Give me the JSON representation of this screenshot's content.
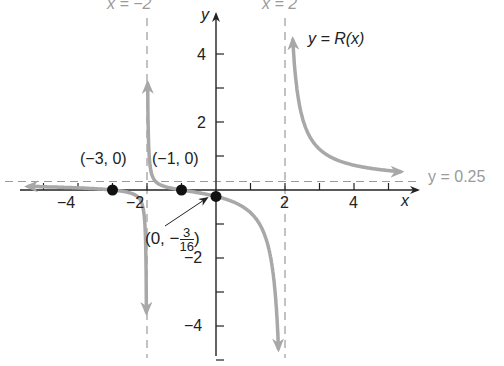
{
  "chart_data": {
    "type": "line",
    "title": "",
    "function_label": "y = R(x)",
    "function": "R(x) = (x+1)(x+3) / (4(x-2)(x+2))",
    "xlabel": "x",
    "ylabel": "y",
    "xlim": [
      -5.5,
      5.5
    ],
    "ylim": [
      -5,
      5
    ],
    "x_ticks": [
      -5,
      -4,
      -3,
      -2,
      -1,
      1,
      2,
      3,
      4,
      5
    ],
    "x_tick_labels": [
      "-4",
      "-2",
      "2",
      "4"
    ],
    "y_ticks": [
      -5,
      -4,
      -3,
      -2,
      -1,
      1,
      2,
      3,
      4
    ],
    "y_tick_labels": [
      "4",
      "2",
      "-2",
      "-4"
    ],
    "grid": false,
    "asymptotes": [
      {
        "type": "vertical",
        "value": -2,
        "label": "x = −2"
      },
      {
        "type": "vertical",
        "value": 2,
        "label": "x = 2"
      },
      {
        "type": "horizontal",
        "value": 0.25,
        "label": "y = 0.25"
      }
    ],
    "points": [
      {
        "x": -3,
        "y": 0,
        "label": "(−3, 0)"
      },
      {
        "x": -1,
        "y": 0,
        "label": "(−1, 0)"
      },
      {
        "x": 0,
        "y": -0.1875,
        "label": "(0, −3/16)"
      }
    ],
    "series": [
      {
        "name": "left branch",
        "x_range": [
          -5.5,
          -2.05
        ]
      },
      {
        "name": "middle branch",
        "x_range": [
          -1.95,
          1.95
        ]
      },
      {
        "name": "right branch",
        "x_range": [
          2.05,
          5.3
        ]
      }
    ],
    "colors": {
      "curve": "#a8a8a8",
      "axis": "#222222",
      "asymptote": "#9a9a9a",
      "point": "#111111"
    }
  },
  "labels": {
    "asym_left": "x = −2",
    "asym_right": "x = 2",
    "asym_horizontal": "y = 0.25",
    "curve_name": "y = R(x)",
    "axis_x": "x",
    "axis_y": "y",
    "tick_x_m4": "−4",
    "tick_x_m2": "−2",
    "tick_x_2": "2",
    "tick_x_4": "4",
    "tick_y_4": "4",
    "tick_y_2": "2",
    "tick_y_m2": "−2",
    "tick_y_m4": "−4",
    "pt_m3": "(−3, 0)",
    "pt_m1": "(−1, 0)",
    "pt_0_prefix": "(0, −",
    "pt_0_num": "3",
    "pt_0_den": "16",
    "pt_0_suffix": ")"
  }
}
